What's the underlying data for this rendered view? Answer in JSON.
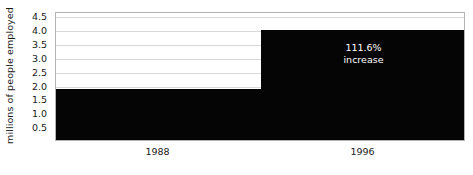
{
  "chart_data": {
    "type": "bar",
    "title": "",
    "xlabel": "",
    "ylabel": "millions of people employed",
    "categories": [
      "1988",
      "1996"
    ],
    "values": [
      1.9,
      4.02
    ],
    "ylim": [
      0,
      4.65
    ],
    "yticks": [
      0.5,
      1.0,
      1.5,
      2.0,
      2.5,
      3.0,
      3.5,
      4.0,
      4.5
    ],
    "ytick_labels": [
      "0.5",
      "1.0",
      "1.5",
      "2.0",
      "2.5",
      "3.0",
      "3.5",
      "4.0",
      "4.5"
    ],
    "grid": true,
    "legend": "none",
    "bar_color": "#050505",
    "grid_color": "#d8d8d8",
    "plot_border_color": "#b4b4b4",
    "annotations": [
      {
        "target_category": "1996",
        "line1": "111.6%",
        "line2": "increase",
        "color": "#ffffff"
      }
    ]
  }
}
